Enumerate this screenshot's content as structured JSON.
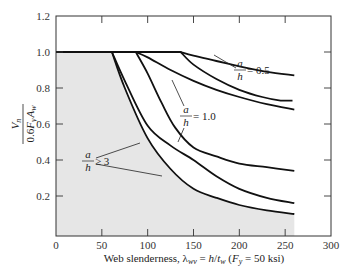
{
  "chart_data": {
    "type": "line",
    "title": "",
    "xlabel": "Web slenderness, λ_wv = h/t_w (F_y = 50 ksi)",
    "xlabel_parts": {
      "prefix": "Web slenderness, ",
      "lambda": "λ",
      "lambda_sub": "wv",
      "eq": " = ",
      "h": "h",
      "slash": "/",
      "t": "t",
      "t_sub": "w",
      "paren_open": " (",
      "F": "F",
      "F_sub": "y",
      "tail": " = 50 ksi)"
    },
    "ylabel": "V_n / (0.6 F_y A_w)",
    "ylabel_parts": {
      "num": "V",
      "num_sub": "n",
      "den_pre": "0.6",
      "den_F": "F",
      "den_F_sub": "y",
      "den_A": "A",
      "den_A_sub": "w"
    },
    "xlim": [
      0,
      300
    ],
    "ylim": [
      0,
      1.2
    ],
    "x_ticks": [
      0,
      50,
      100,
      150,
      200,
      250,
      300
    ],
    "y_ticks": [
      0.2,
      0.4,
      0.6,
      0.8,
      1.0,
      1.2
    ],
    "x_tick_labels": [
      "0",
      "50",
      "100",
      "150",
      "200",
      "250",
      "300"
    ],
    "y_tick_labels": [
      "0.2",
      "0.4",
      "0.6",
      "0.8",
      "1.0",
      "1.2"
    ],
    "grid": false,
    "legend": "none (inline annotations)",
    "plateau": {
      "y": 1.0,
      "x_start": 0,
      "x_end": 136
    },
    "shaded_region": "area under lowest a/h ≥ 3 curve",
    "series": [
      {
        "name": "a/h = 0.5 (upper)",
        "x": [
          0,
          136,
          150,
          175,
          200,
          230,
          260
        ],
        "y": [
          1.0,
          1.0,
          0.98,
          0.95,
          0.92,
          0.89,
          0.87
        ]
      },
      {
        "name": "a/h = 0.5 (lower)",
        "x": [
          0,
          136,
          150,
          175,
          200,
          225,
          245,
          258
        ],
        "y": [
          1.0,
          1.0,
          0.93,
          0.85,
          0.79,
          0.75,
          0.73,
          0.73
        ]
      },
      {
        "name": "a/h = 1.0 (upper)",
        "x": [
          0,
          87,
          100,
          125,
          150,
          175,
          200,
          230,
          260
        ],
        "y": [
          1.0,
          1.0,
          0.97,
          0.9,
          0.84,
          0.79,
          0.75,
          0.71,
          0.68
        ]
      },
      {
        "name": "a/h = 1.0 (lower)",
        "x": [
          0,
          87,
          100,
          115,
          130,
          150,
          175,
          200,
          230,
          260
        ],
        "y": [
          1.0,
          1.0,
          0.88,
          0.72,
          0.58,
          0.47,
          0.42,
          0.38,
          0.36,
          0.34
        ]
      },
      {
        "name": "a/h ≥ 3 (upper)",
        "x": [
          0,
          61,
          75,
          100,
          125,
          150,
          175,
          200,
          230,
          260
        ],
        "y": [
          1.0,
          1.0,
          0.84,
          0.59,
          0.48,
          0.4,
          0.31,
          0.24,
          0.19,
          0.16
        ]
      },
      {
        "name": "a/h ≥ 3 (lower, shaded)",
        "x": [
          0,
          61,
          75,
          100,
          125,
          150,
          175,
          200,
          230,
          260
        ],
        "y": [
          1.0,
          1.0,
          0.8,
          0.52,
          0.35,
          0.24,
          0.19,
          0.15,
          0.12,
          0.1
        ]
      }
    ],
    "annotations": [
      {
        "num": "a",
        "den": "h",
        "rel": " = 0.5",
        "x": 165,
        "y": 0.88
      },
      {
        "num": "a",
        "den": "h",
        "rel": " = 1.0",
        "x": 132,
        "y": 0.62
      },
      {
        "num": "a",
        "den": "h",
        "rel": " ≥ 3",
        "x": 18,
        "y": 0.42
      }
    ]
  },
  "colors": {
    "shade": "#e6e6e6",
    "line": "#111111",
    "axis": "#333333"
  }
}
